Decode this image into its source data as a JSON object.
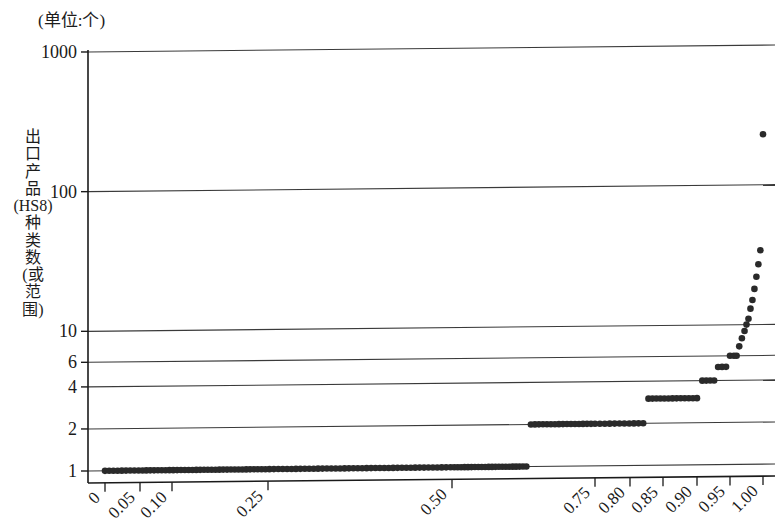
{
  "figure": {
    "unit_note": "(单位:个)",
    "y_axis_title": "出口产品(HS8)种类数(或范围)",
    "y_axis_title_lines": [
      "出",
      "口",
      "产",
      "品",
      "(HS8)",
      "种",
      "类",
      "数",
      "(或",
      "范",
      "围)"
    ],
    "point_color": "#2a2a2a",
    "axis_color": "#1a1a1a",
    "grid_color": "#3a3a3a",
    "background": "#ffffff"
  },
  "chart_data": {
    "type": "scatter",
    "title": "",
    "subtitle": "(单位:个)",
    "xlabel": "",
    "ylabel": "出口产品(HS8)种类数(或范围)",
    "yscale": "log",
    "ylim": [
      1,
      1000
    ],
    "grid": true,
    "legend": null,
    "y_ticks": [
      1,
      2,
      4,
      6,
      10,
      100,
      1000
    ],
    "y_tick_labels": [
      "1",
      "2",
      "4",
      "6",
      "10",
      "100",
      "1000"
    ],
    "x_ticks": [
      0,
      0.05,
      0.1,
      0.25,
      0.5,
      0.75,
      0.8,
      0.85,
      0.9,
      0.95,
      1.0
    ],
    "x_tick_labels": [
      "0",
      "0.05",
      "0.10",
      "0.25",
      "0.50",
      "0.75",
      "0.80",
      "0.85",
      "0.90",
      "0.95",
      "1.00"
    ],
    "x_tick_positions_px": [
      105,
      140,
      172,
      268,
      452,
      595,
      630,
      663,
      697,
      730,
      763
    ],
    "xlim": [
      0,
      1.0
    ],
    "points": [
      {
        "x": 0.0,
        "y": 1
      },
      {
        "x": 0.006,
        "y": 1
      },
      {
        "x": 0.012,
        "y": 1
      },
      {
        "x": 0.018,
        "y": 1
      },
      {
        "x": 0.024,
        "y": 1
      },
      {
        "x": 0.03,
        "y": 1
      },
      {
        "x": 0.036,
        "y": 1
      },
      {
        "x": 0.042,
        "y": 1
      },
      {
        "x": 0.048,
        "y": 1
      },
      {
        "x": 0.054,
        "y": 1
      },
      {
        "x": 0.06,
        "y": 1
      },
      {
        "x": 0.066,
        "y": 1
      },
      {
        "x": 0.072,
        "y": 1
      },
      {
        "x": 0.078,
        "y": 1
      },
      {
        "x": 0.084,
        "y": 1
      },
      {
        "x": 0.09,
        "y": 1
      },
      {
        "x": 0.096,
        "y": 1
      },
      {
        "x": 0.102,
        "y": 1
      },
      {
        "x": 0.108,
        "y": 1
      },
      {
        "x": 0.114,
        "y": 1
      },
      {
        "x": 0.12,
        "y": 1
      },
      {
        "x": 0.126,
        "y": 1
      },
      {
        "x": 0.132,
        "y": 1
      },
      {
        "x": 0.138,
        "y": 1
      },
      {
        "x": 0.144,
        "y": 1
      },
      {
        "x": 0.15,
        "y": 1
      },
      {
        "x": 0.156,
        "y": 1
      },
      {
        "x": 0.162,
        "y": 1
      },
      {
        "x": 0.168,
        "y": 1
      },
      {
        "x": 0.174,
        "y": 1
      },
      {
        "x": 0.18,
        "y": 1
      },
      {
        "x": 0.186,
        "y": 1
      },
      {
        "x": 0.192,
        "y": 1
      },
      {
        "x": 0.198,
        "y": 1
      },
      {
        "x": 0.204,
        "y": 1
      },
      {
        "x": 0.21,
        "y": 1
      },
      {
        "x": 0.216,
        "y": 1
      },
      {
        "x": 0.222,
        "y": 1
      },
      {
        "x": 0.228,
        "y": 1
      },
      {
        "x": 0.234,
        "y": 1
      },
      {
        "x": 0.24,
        "y": 1
      },
      {
        "x": 0.246,
        "y": 1
      },
      {
        "x": 0.252,
        "y": 1
      },
      {
        "x": 0.258,
        "y": 1
      },
      {
        "x": 0.264,
        "y": 1
      },
      {
        "x": 0.27,
        "y": 1
      },
      {
        "x": 0.276,
        "y": 1
      },
      {
        "x": 0.282,
        "y": 1
      },
      {
        "x": 0.288,
        "y": 1
      },
      {
        "x": 0.294,
        "y": 1
      },
      {
        "x": 0.3,
        "y": 1
      },
      {
        "x": 0.306,
        "y": 1
      },
      {
        "x": 0.312,
        "y": 1
      },
      {
        "x": 0.318,
        "y": 1
      },
      {
        "x": 0.324,
        "y": 1
      },
      {
        "x": 0.33,
        "y": 1
      },
      {
        "x": 0.336,
        "y": 1
      },
      {
        "x": 0.342,
        "y": 1
      },
      {
        "x": 0.348,
        "y": 1
      },
      {
        "x": 0.354,
        "y": 1
      },
      {
        "x": 0.36,
        "y": 1
      },
      {
        "x": 0.366,
        "y": 1
      },
      {
        "x": 0.372,
        "y": 1
      },
      {
        "x": 0.378,
        "y": 1
      },
      {
        "x": 0.384,
        "y": 1
      },
      {
        "x": 0.39,
        "y": 1
      },
      {
        "x": 0.396,
        "y": 1
      },
      {
        "x": 0.402,
        "y": 1
      },
      {
        "x": 0.408,
        "y": 1
      },
      {
        "x": 0.414,
        "y": 1
      },
      {
        "x": 0.42,
        "y": 1
      },
      {
        "x": 0.426,
        "y": 1
      },
      {
        "x": 0.432,
        "y": 1
      },
      {
        "x": 0.438,
        "y": 1
      },
      {
        "x": 0.444,
        "y": 1
      },
      {
        "x": 0.45,
        "y": 1
      },
      {
        "x": 0.456,
        "y": 1
      },
      {
        "x": 0.462,
        "y": 1
      },
      {
        "x": 0.468,
        "y": 1
      },
      {
        "x": 0.474,
        "y": 1
      },
      {
        "x": 0.48,
        "y": 1
      },
      {
        "x": 0.486,
        "y": 1
      },
      {
        "x": 0.492,
        "y": 1
      },
      {
        "x": 0.498,
        "y": 1
      },
      {
        "x": 0.504,
        "y": 1
      },
      {
        "x": 0.51,
        "y": 1
      },
      {
        "x": 0.516,
        "y": 1
      },
      {
        "x": 0.522,
        "y": 1
      },
      {
        "x": 0.528,
        "y": 1
      },
      {
        "x": 0.534,
        "y": 1
      },
      {
        "x": 0.54,
        "y": 1
      },
      {
        "x": 0.546,
        "y": 1
      },
      {
        "x": 0.552,
        "y": 1
      },
      {
        "x": 0.558,
        "y": 1
      },
      {
        "x": 0.564,
        "y": 1
      },
      {
        "x": 0.57,
        "y": 1
      },
      {
        "x": 0.576,
        "y": 1
      },
      {
        "x": 0.582,
        "y": 1
      },
      {
        "x": 0.588,
        "y": 1
      },
      {
        "x": 0.594,
        "y": 1
      },
      {
        "x": 0.6,
        "y": 1
      },
      {
        "x": 0.606,
        "y": 1
      },
      {
        "x": 0.612,
        "y": 1
      },
      {
        "x": 0.618,
        "y": 1
      },
      {
        "x": 0.624,
        "y": 1
      },
      {
        "x": 0.63,
        "y": 1
      },
      {
        "x": 0.638,
        "y": 2
      },
      {
        "x": 0.645,
        "y": 2
      },
      {
        "x": 0.652,
        "y": 2
      },
      {
        "x": 0.659,
        "y": 2
      },
      {
        "x": 0.666,
        "y": 2
      },
      {
        "x": 0.673,
        "y": 2
      },
      {
        "x": 0.68,
        "y": 2
      },
      {
        "x": 0.687,
        "y": 2
      },
      {
        "x": 0.694,
        "y": 2
      },
      {
        "x": 0.701,
        "y": 2
      },
      {
        "x": 0.708,
        "y": 2
      },
      {
        "x": 0.715,
        "y": 2
      },
      {
        "x": 0.722,
        "y": 2
      },
      {
        "x": 0.729,
        "y": 2
      },
      {
        "x": 0.736,
        "y": 2
      },
      {
        "x": 0.743,
        "y": 2
      },
      {
        "x": 0.75,
        "y": 2
      },
      {
        "x": 0.757,
        "y": 2
      },
      {
        "x": 0.764,
        "y": 2
      },
      {
        "x": 0.771,
        "y": 2
      },
      {
        "x": 0.778,
        "y": 2
      },
      {
        "x": 0.785,
        "y": 2
      },
      {
        "x": 0.792,
        "y": 2
      },
      {
        "x": 0.799,
        "y": 2
      },
      {
        "x": 0.806,
        "y": 2
      },
      {
        "x": 0.813,
        "y": 2
      },
      {
        "x": 0.82,
        "y": 2
      },
      {
        "x": 0.828,
        "y": 3
      },
      {
        "x": 0.834,
        "y": 3
      },
      {
        "x": 0.84,
        "y": 3
      },
      {
        "x": 0.846,
        "y": 3
      },
      {
        "x": 0.852,
        "y": 3
      },
      {
        "x": 0.858,
        "y": 3
      },
      {
        "x": 0.864,
        "y": 3
      },
      {
        "x": 0.87,
        "y": 3
      },
      {
        "x": 0.876,
        "y": 3
      },
      {
        "x": 0.882,
        "y": 3
      },
      {
        "x": 0.888,
        "y": 3
      },
      {
        "x": 0.894,
        "y": 3
      },
      {
        "x": 0.9,
        "y": 3
      },
      {
        "x": 0.908,
        "y": 4
      },
      {
        "x": 0.914,
        "y": 4
      },
      {
        "x": 0.92,
        "y": 4
      },
      {
        "x": 0.926,
        "y": 4
      },
      {
        "x": 0.932,
        "y": 5
      },
      {
        "x": 0.938,
        "y": 5
      },
      {
        "x": 0.944,
        "y": 5
      },
      {
        "x": 0.95,
        "y": 6
      },
      {
        "x": 0.956,
        "y": 6
      },
      {
        "x": 0.96,
        "y": 6
      },
      {
        "x": 0.964,
        "y": 7
      },
      {
        "x": 0.968,
        "y": 8
      },
      {
        "x": 0.972,
        "y": 9
      },
      {
        "x": 0.975,
        "y": 10
      },
      {
        "x": 0.978,
        "y": 11
      },
      {
        "x": 0.981,
        "y": 13
      },
      {
        "x": 0.984,
        "y": 15
      },
      {
        "x": 0.987,
        "y": 18
      },
      {
        "x": 0.99,
        "y": 22
      },
      {
        "x": 0.993,
        "y": 27
      },
      {
        "x": 0.996,
        "y": 34
      },
      {
        "x": 1.0,
        "y": 230
      }
    ]
  }
}
